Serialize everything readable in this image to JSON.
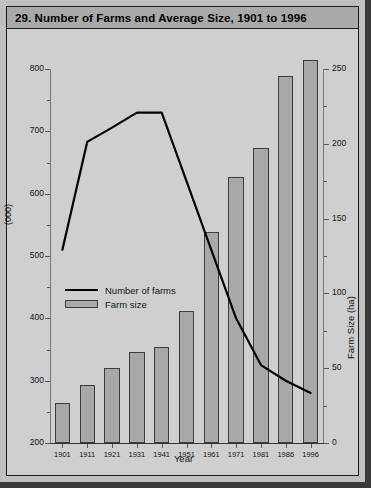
{
  "figure": {
    "caption": "29. Number of Farms and Average Size, 1901 to 1996"
  },
  "chart_data": {
    "type": "bar",
    "title": "29. Number of Farms and Average Size, 1901 to 1996",
    "xlabel": "Year",
    "ylabel": "(000)",
    "y2label": "Farm Size (ha)",
    "categories": [
      "1901",
      "1911",
      "1921",
      "1931",
      "1941",
      "1951",
      "1961",
      "1971",
      "1981",
      "1986",
      "1996"
    ],
    "ylim": [
      200,
      800
    ],
    "y2lim": [
      0,
      250
    ],
    "yticks": [
      "200",
      "300",
      "400",
      "500",
      "600",
      "700",
      "800"
    ],
    "y2ticks": [
      "0",
      "50",
      "100",
      "150",
      "200",
      "250"
    ],
    "grid": false,
    "legend_position": "center-left",
    "series": [
      {
        "name": "Number of farms",
        "type": "line",
        "axis": "left",
        "unit": "(000)",
        "values": [
          510,
          683,
          706,
          730,
          730,
          620,
          510,
          400,
          325,
          300,
          280
        ]
      },
      {
        "name": "Farm size",
        "type": "bar",
        "axis": "right",
        "unit": "ha",
        "values": [
          27,
          39,
          50,
          61,
          64,
          88,
          141,
          178,
          197,
          245,
          256
        ]
      }
    ]
  },
  "legend": {
    "items": [
      {
        "label": "Number of farms",
        "marker": "line"
      },
      {
        "label": "Farm size",
        "marker": "box"
      }
    ]
  },
  "colors": {
    "bar_fill": "#a8a8a8",
    "bar_stroke": "#3c3c3c",
    "line": "#000000",
    "panel_bg": "#cfcfcf",
    "title_bg": "#a9a9a9",
    "page_bg": "#c0c0c0"
  }
}
